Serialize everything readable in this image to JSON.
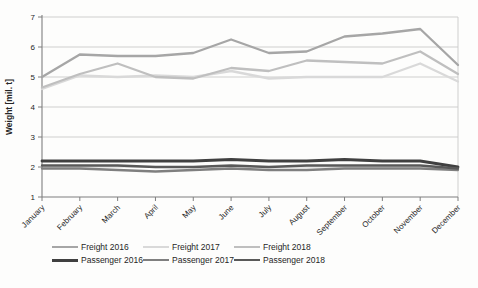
{
  "chart_data": {
    "type": "line",
    "title": "",
    "xlabel": "",
    "ylabel": "Weight [mil. t]",
    "ylim": [
      1,
      7
    ],
    "yticks": [
      1,
      2,
      3,
      4,
      5,
      6,
      7
    ],
    "grid": "horizontal",
    "legend_position": "bottom",
    "categories": [
      "January",
      "February",
      "March",
      "April",
      "May",
      "June",
      "July",
      "August",
      "September",
      "October",
      "November",
      "December"
    ],
    "series": [
      {
        "name": "Freight 2016",
        "color": "#a6a6a6",
        "values": [
          5.0,
          5.75,
          5.7,
          5.7,
          5.8,
          6.25,
          5.8,
          5.85,
          6.35,
          6.45,
          6.6,
          5.4
        ]
      },
      {
        "name": "Freight 2017",
        "color": "#d9d9d9",
        "values": [
          4.6,
          5.05,
          5.0,
          5.05,
          5.0,
          5.2,
          4.95,
          5.0,
          5.0,
          5.0,
          5.45,
          4.85
        ]
      },
      {
        "name": "Freight 2018",
        "color": "#bfbfbf",
        "values": [
          4.65,
          5.1,
          5.45,
          5.0,
          4.95,
          5.3,
          5.2,
          5.55,
          5.5,
          5.45,
          5.85,
          5.1
        ]
      },
      {
        "name": "Passenger 2016",
        "color": "#404040",
        "values": [
          2.2,
          2.2,
          2.2,
          2.2,
          2.2,
          2.25,
          2.2,
          2.2,
          2.25,
          2.2,
          2.2,
          2.0
        ]
      },
      {
        "name": "Passenger 2017",
        "color": "#7f7f7f",
        "values": [
          1.95,
          1.95,
          1.9,
          1.85,
          1.9,
          1.95,
          1.9,
          1.9,
          1.95,
          1.95,
          1.95,
          1.9
        ]
      },
      {
        "name": "Passenger 2018",
        "color": "#595959",
        "values": [
          2.05,
          2.05,
          2.05,
          2.0,
          2.0,
          2.05,
          2.0,
          2.05,
          2.05,
          2.05,
          2.05,
          1.95
        ]
      }
    ],
    "axis_color": "#7f7f7f",
    "gridline_color": "#c9c9c9",
    "plot_border_color": "#c9c9c9"
  }
}
